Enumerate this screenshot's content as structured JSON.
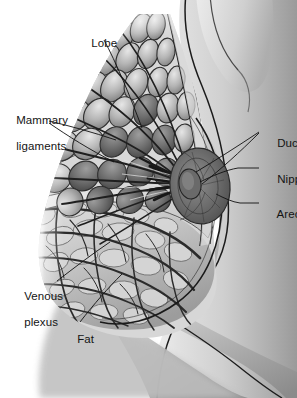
{
  "figure": {
    "type": "anatomical-illustration",
    "view": "lateral sagittal cross-section",
    "style": "grayscale medical illustration",
    "palette": {
      "background": "#ffffff",
      "skin_light": "#e8e8e8",
      "skin_mid": "#b9b9b9",
      "skin_shadow": "#8d8d8d",
      "torso_outline": "#1d1d1d",
      "gland_light": "#d6d6d6",
      "gland_mid": "#9a9a9a",
      "gland_dark": "#4a4a4a",
      "duct_dark": "#2e2e2e",
      "areola_dark": "#5c5c5c",
      "fat_light": "#dcdcdc",
      "vein_dark": "#333333",
      "label_text": "#141414",
      "leader_line": "#1a1a1a"
    }
  },
  "labels": [
    {
      "id": "lobe",
      "text": "Lobe",
      "side": "left",
      "x": 78,
      "y": 30,
      "lines": [
        "Lobe"
      ]
    },
    {
      "id": "mammary-ligaments",
      "text": "Mammary ligaments",
      "side": "left",
      "x": 3,
      "y": 107,
      "lines": [
        "Mammary",
        "ligaments"
      ]
    },
    {
      "id": "venous-plexus",
      "text": "Venous plexus",
      "side": "left",
      "x": 11,
      "y": 283,
      "lines": [
        "Venous",
        "plexus"
      ]
    },
    {
      "id": "fat",
      "text": "Fat",
      "side": "left",
      "x": 64,
      "y": 326,
      "lines": [
        "Fat"
      ]
    },
    {
      "id": "ducts",
      "text": "Ducts",
      "side": "right",
      "x": 262,
      "y": 128,
      "lines": [
        "Ducts"
      ]
    },
    {
      "id": "nipple",
      "text": "Nipple",
      "side": "right",
      "x": 262,
      "y": 164,
      "lines": [
        "Nipple"
      ]
    },
    {
      "id": "areola",
      "text": "Areola",
      "side": "right",
      "x": 262,
      "y": 199,
      "lines": [
        "Areola"
      ]
    }
  ],
  "structures": [
    {
      "id": "lobe",
      "name": "Lobe",
      "description": "Glandular lobules of the mammary gland"
    },
    {
      "id": "mammary-ligaments",
      "name": "Mammary ligaments",
      "description": "Suspensory ligaments of Cooper"
    },
    {
      "id": "ducts",
      "name": "Ducts",
      "description": "Lactiferous ducts converging on the nipple"
    },
    {
      "id": "nipple",
      "name": "Nipple",
      "description": "Central projection of the breast"
    },
    {
      "id": "areola",
      "name": "Areola",
      "description": "Pigmented disc surrounding the nipple"
    },
    {
      "id": "venous-plexus",
      "name": "Venous plexus",
      "description": "Subcutaneous venous network"
    },
    {
      "id": "fat",
      "name": "Fat",
      "description": "Adipose tissue of the breast"
    }
  ]
}
